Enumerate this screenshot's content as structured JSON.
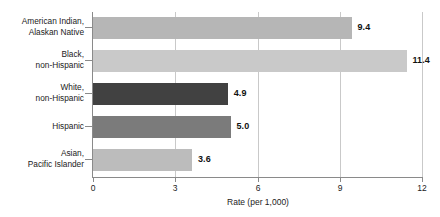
{
  "chart_data": {
    "type": "bar",
    "orientation": "horizontal",
    "title": "",
    "subtitle": "",
    "xlabel": "Rate (per 1,000)",
    "ylabel": "",
    "categories": [
      "American Indian,\nAlaskan Native",
      "Black,\nnon-Hispanic",
      "White,\nnon-Hispanic",
      "Hispanic",
      "Asian,\nPacific Islander"
    ],
    "values": [
      9.4,
      11.4,
      4.9,
      5.0,
      3.6
    ],
    "value_labels": [
      "9.4",
      "11.4",
      "4.9",
      "5.0",
      "3.6"
    ],
    "bar_colors": [
      "#b6b6b6",
      "#c9c9c9",
      "#414141",
      "#7b7b7b",
      "#bcbcbc"
    ],
    "xlim": [
      0,
      12
    ],
    "xticks": [
      0,
      3,
      6,
      9,
      12
    ],
    "xtick_labels": [
      "0",
      "3",
      "6",
      "9",
      "12"
    ],
    "grid": "vertical",
    "legend": "none",
    "axis_color": "#8a8a8a",
    "grid_color": "#c9c9c9",
    "background": "#ffffff"
  }
}
